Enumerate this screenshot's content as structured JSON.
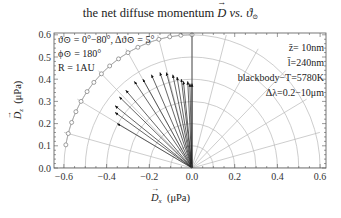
{
  "title": {
    "prefix": "the net diffuse momentum ",
    "vector": "D",
    "middle": " vs. ",
    "symbol": "ϑ",
    "subscript": "⊙"
  },
  "axes": {
    "xlabel_vector": "D",
    "xlabel_sub": "x",
    "xlabel_unit": "(μPa)",
    "ylabel_vector": "D",
    "ylabel_sub": "z",
    "ylabel_unit": "(μPa)"
  },
  "annotations": {
    "left": [
      "ϑ⊙ = 0°−80°, Δϑ⊙ = 5°",
      "ϕ⊙ = 180°",
      "R = 1AU"
    ],
    "right": [
      "z̄=  10nm",
      "l̄=240nm",
      "blackbody−T=5780K",
      "Δλ=0.2−10μm"
    ]
  },
  "chart_data": {
    "type": "scatter",
    "subtype": "vector-field / polar",
    "title": "the net diffuse momentum D vs. ϑ⊙",
    "xlabel": "D_x (μPa)",
    "ylabel": "D_z (μPa)",
    "xlim": [
      -0.64,
      0.64
    ],
    "ylim": [
      0,
      0.61
    ],
    "xticks": [
      -0.6,
      -0.4,
      -0.2,
      0.0,
      0.2,
      0.4,
      0.6
    ],
    "xtick_labels": [
      "−0.6",
      "−0.4",
      "−0.2",
      "0.0",
      "0.2",
      "0.4",
      "0.6"
    ],
    "yticks": [
      0.0,
      0.1,
      0.2,
      0.3,
      0.4,
      0.5,
      0.6
    ],
    "ytick_labels": [
      "0.0",
      "0.1",
      "0.2",
      "0.3",
      "0.4",
      "0.5",
      "0.6"
    ],
    "grid": "polar",
    "polar_grid": {
      "radii": [
        0.1,
        0.2,
        0.3,
        0.4,
        0.5,
        0.6
      ],
      "angles_deg": [
        0,
        15,
        30,
        45,
        60,
        75,
        90,
        105,
        120,
        135,
        150,
        165,
        180
      ]
    },
    "series": [
      {
        "name": "D vectors (ϑ⊙ = 0°…80°, step 5°)",
        "kind": "arrows",
        "origin": [
          0,
          0
        ],
        "tips": [
          [
            -0.35,
            0.2
          ],
          [
            -0.36,
            0.25
          ],
          [
            -0.36,
            0.28
          ],
          [
            -0.34,
            0.32
          ],
          [
            -0.31,
            0.35
          ],
          [
            -0.27,
            0.39
          ],
          [
            -0.23,
            0.4
          ],
          [
            -0.19,
            0.42
          ],
          [
            -0.15,
            0.43
          ],
          [
            -0.12,
            0.43
          ],
          [
            -0.09,
            0.42
          ],
          [
            -0.07,
            0.41
          ],
          [
            -0.05,
            0.4
          ],
          [
            -0.04,
            0.39
          ],
          [
            -0.02,
            0.39
          ],
          [
            -0.01,
            0.38
          ],
          [
            0.0,
            0.38
          ]
        ]
      },
      {
        "name": "sun direction markers",
        "kind": "circle-markers-on-arc",
        "radius": 0.6,
        "angles_deg": [
          90,
          95,
          100,
          105,
          110,
          115,
          120,
          125,
          130,
          135,
          140,
          145,
          150,
          155,
          160,
          165,
          170
        ]
      }
    ],
    "legend": "none"
  }
}
